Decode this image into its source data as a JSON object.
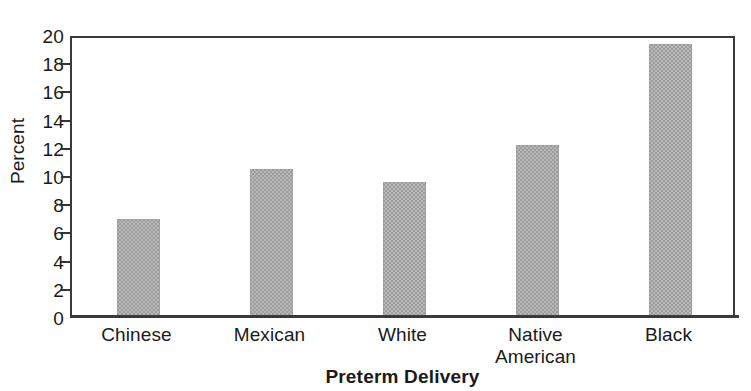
{
  "chart_data": {
    "type": "bar",
    "title": "",
    "xlabel": "Preterm Delivery",
    "ylabel": "Percent",
    "categories": [
      "Chinese",
      "Mexican",
      "White",
      "Native American",
      "Black"
    ],
    "values": [
      6.9,
      10.4,
      9.5,
      12.1,
      19.3
    ],
    "ylim": [
      0,
      20
    ],
    "ytick_values": [
      0,
      2,
      4,
      6,
      8,
      10,
      12,
      14,
      16,
      18,
      20
    ],
    "ytick_labels": [
      "0",
      "2",
      "4",
      "6",
      "8",
      "10",
      "12",
      "14",
      "16",
      "18",
      "20"
    ],
    "grid": false,
    "legend": false,
    "bar_color": "#a9a9a9",
    "axis_color": "#3a3a3a"
  },
  "axes": {
    "y_label": "Percent",
    "x_title": "Preterm Delivery",
    "ticks": [
      {
        "label": "20"
      },
      {
        "label": "18"
      },
      {
        "label": "16"
      },
      {
        "label": "14"
      },
      {
        "label": "12"
      },
      {
        "label": "10"
      },
      {
        "label": "8"
      },
      {
        "label": "6"
      },
      {
        "label": "4"
      },
      {
        "label": "2"
      },
      {
        "label": "0"
      }
    ]
  },
  "categories": [
    {
      "line1": "Chinese",
      "line2": ""
    },
    {
      "line1": "Mexican",
      "line2": ""
    },
    {
      "line1": "White",
      "line2": ""
    },
    {
      "line1": "Native",
      "line2": "American"
    },
    {
      "line1": "Black",
      "line2": ""
    }
  ]
}
